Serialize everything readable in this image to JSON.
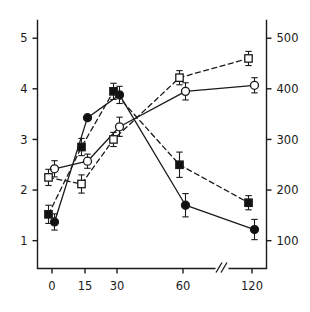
{
  "chart_data": {
    "type": "line",
    "title": "",
    "subtitle": "",
    "xlabel": "",
    "ylabel": "",
    "y2label": "",
    "grid": false,
    "legend_position": "none",
    "x_categories": [
      "0",
      "15",
      "30",
      "60",
      "120"
    ],
    "x_tick_labels": [
      "0",
      "15",
      "30",
      "60",
      "120"
    ],
    "x_axis_break": true,
    "x_axis_break_between": [
      "60",
      "120"
    ],
    "x_axis_break_symbol": "//",
    "left_axis": {
      "ticks": [
        "1",
        "2",
        "3",
        "4",
        "5"
      ],
      "values": [
        1,
        2,
        3,
        4,
        5
      ],
      "ylim": [
        0.45,
        5.35
      ]
    },
    "right_axis": {
      "ticks": [
        "100",
        "200",
        "300",
        "400",
        "500"
      ],
      "values": [
        100,
        200,
        300,
        400,
        500
      ],
      "ylim": [
        45,
        535
      ]
    },
    "series": [
      {
        "name": "filled-circle-solid",
        "marker": "filled-circle",
        "line_style": "solid",
        "axis": "left",
        "values": [
          1.37,
          3.43,
          3.88,
          1.7,
          1.22
        ],
        "errors": [
          0.16,
          0.0,
          0.17,
          0.23,
          0.2
        ]
      },
      {
        "name": "filled-square-dashed",
        "marker": "filled-square",
        "line_style": "dashed",
        "axis": "left",
        "values": [
          1.52,
          2.85,
          3.95,
          2.5,
          1.75
        ],
        "errors": [
          0.18,
          0.17,
          0.16,
          0.25,
          0.14
        ]
      },
      {
        "name": "open-circle-solid",
        "marker": "open-circle",
        "line_style": "solid",
        "axis": "right",
        "values": [
          2.42,
          2.57,
          3.25,
          3.95,
          4.07
        ],
        "errors": [
          0.16,
          0.14,
          0.19,
          0.17,
          0.15
        ]
      },
      {
        "name": "open-square-dashed",
        "marker": "open-square",
        "line_style": "dashed",
        "axis": "right",
        "values": [
          2.25,
          2.12,
          3.0,
          4.22,
          4.6
        ],
        "errors": [
          0.16,
          0.18,
          0.14,
          0.14,
          0.14
        ]
      }
    ],
    "colors": {
      "axis": "#1a1a1a",
      "line": "#1a1a1a",
      "marker_fill": "#111111",
      "marker_open_fill": "#ffffff",
      "background": "#ffffff"
    }
  }
}
